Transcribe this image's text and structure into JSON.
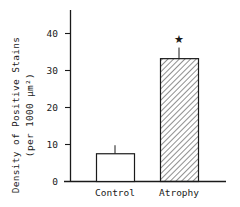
{
  "chart_data": {
    "type": "bar",
    "title": "",
    "xlabel": "",
    "ylabel": "Density of Positive Stains",
    "ylabel_sub": "(per 1000 µm²)",
    "categories": [
      "Control",
      "Atrophy"
    ],
    "values": [
      7.5,
      33.2
    ],
    "error_upper": [
      9.8,
      36.2
    ],
    "errors": [
      2.3,
      3.0
    ],
    "bar_styles": [
      "open",
      "hatched"
    ],
    "annotations": [
      {
        "category": "Atrophy",
        "text": "★",
        "meaning": "significant difference"
      }
    ],
    "yticks": [
      "0",
      "10",
      "20",
      "30",
      "40"
    ],
    "ylim": [
      0,
      47
    ],
    "grid": false,
    "legend": "none"
  },
  "colors": {
    "ink": "#1a1a1a",
    "background": "#ffffff"
  }
}
